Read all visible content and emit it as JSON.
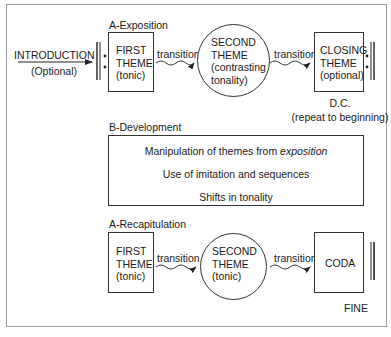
{
  "diagram": {
    "exposition": {
      "section_label": "A-Exposition",
      "introduction": {
        "line1": "INTRODUCTION",
        "line2": "(Optional)"
      },
      "first_theme": {
        "line1": "FIRST",
        "line2": "THEME",
        "line3": "(tonic)"
      },
      "transition1": "transition",
      "second_theme": {
        "line1": "SECOND",
        "line2": "THEME",
        "line3": "(contrasting",
        "line4": "tonality)"
      },
      "transition2": "transition",
      "closing_theme": {
        "line1": "CLOSING",
        "line2": "THEME",
        "line3": "(optional)"
      },
      "dc": {
        "line1": "D.C.",
        "line2": "(repeat to beginning)"
      }
    },
    "development": {
      "section_label": "B-Development",
      "items": [
        {
          "text": "Manipulation of themes from ",
          "italic": "exposition"
        },
        {
          "text": "Use of imitation and sequences"
        },
        {
          "text": "Shifts in tonality"
        }
      ]
    },
    "recapitulation": {
      "section_label": "A-Recapitulation",
      "first_theme": {
        "line1": "FIRST",
        "line2": "THEME",
        "line3": "(tonic)"
      },
      "transition1": "transition",
      "second_theme": {
        "line1": "SECOND",
        "line2": "THEME",
        "line3": "(tonic)"
      },
      "transition2": "transition",
      "coda": "CODA",
      "fine": "FINE"
    },
    "colors": {
      "stroke": "#333333",
      "frame": "#9a9a9a",
      "text": "#1a1a1a"
    }
  }
}
